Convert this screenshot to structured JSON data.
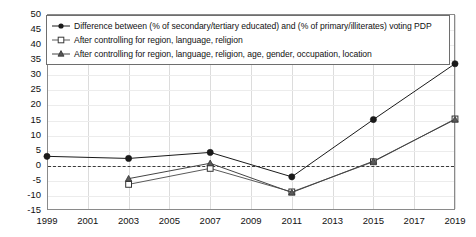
{
  "chart_data": {
    "type": "line",
    "title": "",
    "xlabel": "",
    "ylabel": "",
    "x": [
      1999,
      2001,
      2003,
      2005,
      2007,
      2009,
      2011,
      2013,
      2015,
      2017,
      2019
    ],
    "xtick_labels": [
      "1999",
      "2001",
      "2003",
      "2005",
      "2007",
      "2009",
      "2011",
      "2013",
      "2015",
      "2017",
      "2019"
    ],
    "xlim": [
      1999,
      2019
    ],
    "ylim": [
      -15,
      50
    ],
    "ytick_labels": [
      "50",
      "45",
      "40",
      "35",
      "30",
      "25",
      "20",
      "15",
      "10",
      "5",
      "0",
      "-5",
      "-10",
      "-15"
    ],
    "yticks": [
      50,
      45,
      40,
      35,
      30,
      25,
      20,
      15,
      10,
      5,
      0,
      -5,
      -10,
      -15
    ],
    "grid": "both",
    "legend_position": "top-left-inside",
    "reference_line": {
      "y": 0,
      "style": "dashed",
      "color": "#3a3a3a"
    },
    "series": [
      {
        "name": "Difference between (% of secondary/tertiary educated) and (% of primary/illiterates) voting PDP",
        "marker": "filled-circle",
        "color": "#1a1a1a",
        "points": [
          {
            "x": 1999,
            "y": 2.8
          },
          {
            "x": 2003,
            "y": 2.1
          },
          {
            "x": 2007,
            "y": 4.1
          },
          {
            "x": 2011,
            "y": -4.0
          },
          {
            "x": 2015,
            "y": 15.0
          },
          {
            "x": 2019,
            "y": 33.5
          }
        ]
      },
      {
        "name": "After controlling for region, language, religion",
        "marker": "open-square",
        "color": "#5a5a5a",
        "points": [
          {
            "x": 2003,
            "y": -6.5
          },
          {
            "x": 2007,
            "y": -1.2
          },
          {
            "x": 2011,
            "y": -9.0
          },
          {
            "x": 2015,
            "y": 1.0
          },
          {
            "x": 2019,
            "y": 15.2
          }
        ]
      },
      {
        "name": "After controlling for region, language, religion, age, gender, occupation, location",
        "marker": "triangle",
        "color": "#444444",
        "points": [
          {
            "x": 2003,
            "y": -4.6
          },
          {
            "x": 2007,
            "y": 0.5
          },
          {
            "x": 2011,
            "y": -9.2
          },
          {
            "x": 2015,
            "y": 1.2
          },
          {
            "x": 2019,
            "y": 15.0
          }
        ]
      }
    ]
  },
  "legend": {
    "items": [
      {
        "label": "Difference between (% of secondary/tertiary educated) and (% of primary/illiterates) voting PDP",
        "marker": "filled-circle"
      },
      {
        "label": "After controlling for region, language, religion",
        "marker": "open-square"
      },
      {
        "label": "After controlling for region, language, religion, age, gender, occupation, location",
        "marker": "triangle"
      }
    ]
  },
  "colors": {
    "axis": "#8a8a8a",
    "grid_vertical": "#dcdcdc",
    "grid_horizontal": "#ececec",
    "series_primary": "#1a1a1a",
    "series_secondary": "#5a5a5a",
    "series_tertiary": "#444444",
    "zero_line": "#3a3a3a",
    "background": "#ffffff"
  }
}
